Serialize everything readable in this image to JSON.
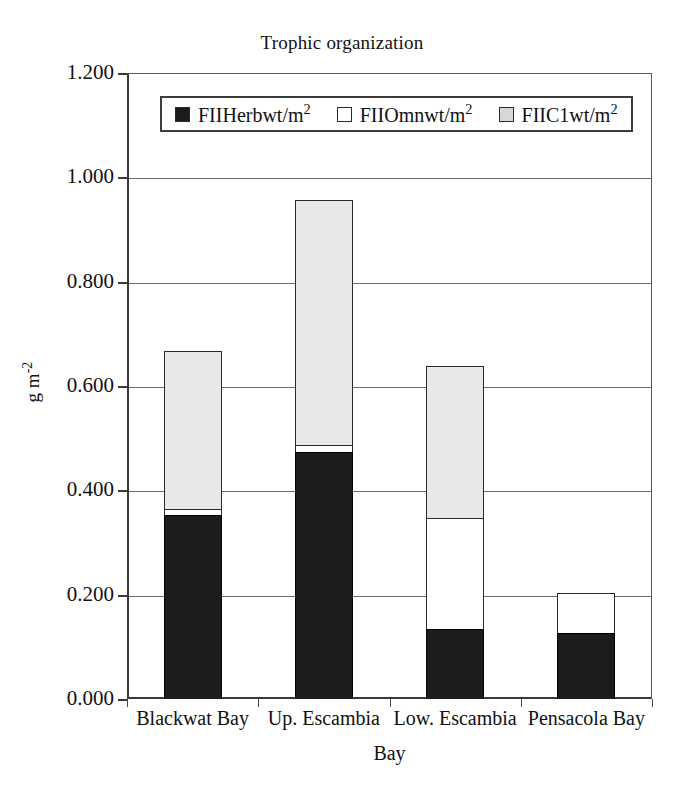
{
  "chart_data": {
    "type": "bar",
    "subtype": "stacked-bar",
    "title": "Trophic organization",
    "xlabel": "Bay",
    "ylabel": "g m-2",
    "ylabel_display": "g m",
    "ylabel_exponent": "-2",
    "categories": [
      "Blackwat Bay",
      "Up. Escambia",
      "Low. Escambia",
      "Pensacola Bay"
    ],
    "series": [
      {
        "name": "FIIHerbwt/m2",
        "label_base": "FIIHerbwt/m",
        "label_exponent": "2",
        "color": "#1c1c1c",
        "values": [
          0.352,
          0.473,
          0.134,
          0.127
        ]
      },
      {
        "name": "FIIOmnwt/m2",
        "label_base": "FIIOmnwt/m",
        "label_exponent": "2",
        "color": "#ffffff",
        "values": [
          0.012,
          0.014,
          0.213,
          0.076
        ]
      },
      {
        "name": "FIIC1wt/m2",
        "label_base": "FIIC1wt/m",
        "label_exponent": "2",
        "color": "#e8e8e8",
        "values": [
          0.303,
          0.47,
          0.291,
          0.0
        ]
      }
    ],
    "totals": [
      0.667,
      0.957,
      0.638,
      0.203
    ],
    "ylim": [
      0.0,
      1.2
    ],
    "ytick_values": [
      0.0,
      0.2,
      0.4,
      0.6,
      0.8,
      1.0,
      1.2
    ],
    "ytick_labels": [
      "0.000",
      "0.200",
      "0.400",
      "0.600",
      "0.800",
      "1.000",
      "1.200"
    ],
    "grid": true,
    "grid_axis": "y",
    "legend_position": "top-inside",
    "background_color": "#ffffff",
    "axis_color": "#3a3a3a"
  }
}
